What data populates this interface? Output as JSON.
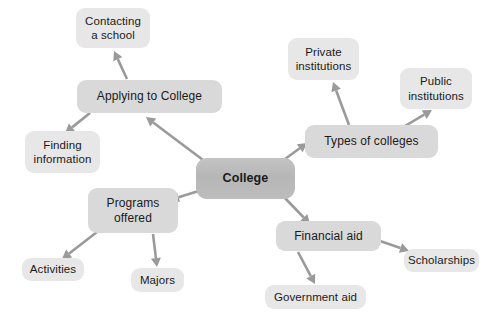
{
  "diagram": {
    "type": "mind-map",
    "title": "College",
    "background_color": "#ffffff",
    "colors": {
      "root_fill": "#bababa",
      "branch_fill": "#d9d9d9",
      "leaf_fill": "#e7e7e7",
      "arrow": "#9a9a9a",
      "text": "#1a1a1a"
    },
    "root": {
      "id": "college",
      "label": "College",
      "x": 196,
      "y": 158,
      "w": 99,
      "h": 41
    },
    "nodes": [
      {
        "id": "applying",
        "label": "Applying to College",
        "level": "branch",
        "x": 77,
        "y": 80,
        "w": 145,
        "h": 33
      },
      {
        "id": "contacting",
        "label": "Contacting\na school",
        "level": "leaf",
        "x": 76,
        "y": 8,
        "w": 74,
        "h": 40
      },
      {
        "id": "finding",
        "label": "Finding\ninformation",
        "level": "leaf",
        "x": 25,
        "y": 131,
        "w": 75,
        "h": 42
      },
      {
        "id": "types",
        "label": "Types of colleges",
        "level": "branch",
        "x": 305,
        "y": 125,
        "w": 133,
        "h": 33
      },
      {
        "id": "private",
        "label": "Private\ninstitutions",
        "level": "leaf",
        "x": 288,
        "y": 38,
        "w": 71,
        "h": 42
      },
      {
        "id": "public",
        "label": "Public\ninstitutions",
        "level": "leaf",
        "x": 400,
        "y": 68,
        "w": 72,
        "h": 41
      },
      {
        "id": "programs",
        "label": "Programs\noffered",
        "level": "branch",
        "x": 88,
        "y": 188,
        "w": 90,
        "h": 45
      },
      {
        "id": "activities",
        "label": "Activities",
        "level": "leaf",
        "x": 22,
        "y": 258,
        "w": 62,
        "h": 23
      },
      {
        "id": "majors",
        "label": "Majors",
        "level": "leaf",
        "x": 131,
        "y": 268,
        "w": 53,
        "h": 24
      },
      {
        "id": "financial",
        "label": "Financial aid",
        "level": "branch",
        "x": 276,
        "y": 221,
        "w": 105,
        "h": 30
      },
      {
        "id": "scholarships",
        "label": "Scholarships",
        "level": "leaf",
        "x": 404,
        "y": 249,
        "w": 75,
        "h": 23
      },
      {
        "id": "government",
        "label": "Government aid",
        "level": "leaf",
        "x": 265,
        "y": 285,
        "w": 101,
        "h": 24
      }
    ],
    "edges": [
      {
        "id": "college-applying",
        "from": "college",
        "to": "applying",
        "x1": 207,
        "y1": 163,
        "x2": 146,
        "y2": 117
      },
      {
        "id": "college-types",
        "from": "college",
        "to": "types",
        "x1": 281,
        "y1": 162,
        "x2": 307,
        "y2": 143
      },
      {
        "id": "college-programs",
        "from": "college",
        "to": "programs",
        "x1": 205,
        "y1": 189,
        "x2": 170,
        "y2": 200
      },
      {
        "id": "college-financial",
        "from": "college",
        "to": "financial",
        "x1": 283,
        "y1": 196,
        "x2": 310,
        "y2": 224
      },
      {
        "id": "applying-contacting",
        "from": "applying",
        "to": "contacting",
        "x1": 127,
        "y1": 79,
        "x2": 114,
        "y2": 51
      },
      {
        "id": "applying-finding",
        "from": "applying",
        "to": "finding",
        "x1": 90,
        "y1": 113,
        "x2": 65,
        "y2": 133
      },
      {
        "id": "types-private",
        "from": "types",
        "to": "private",
        "x1": 349,
        "y1": 125,
        "x2": 333,
        "y2": 82
      },
      {
        "id": "types-public",
        "from": "types",
        "to": "public",
        "x1": 405,
        "y1": 126,
        "x2": 432,
        "y2": 110
      },
      {
        "id": "programs-activities",
        "from": "programs",
        "to": "activities",
        "x1": 97,
        "y1": 232,
        "x2": 62,
        "y2": 259
      },
      {
        "id": "programs-majors",
        "from": "programs",
        "to": "majors",
        "x1": 153,
        "y1": 234,
        "x2": 157,
        "y2": 267
      },
      {
        "id": "financial-scholarships",
        "from": "financial",
        "to": "scholarships",
        "x1": 380,
        "y1": 241,
        "x2": 409,
        "y2": 251
      },
      {
        "id": "financial-government",
        "from": "financial",
        "to": "government",
        "x1": 298,
        "y1": 252,
        "x2": 315,
        "y2": 284
      }
    ]
  }
}
